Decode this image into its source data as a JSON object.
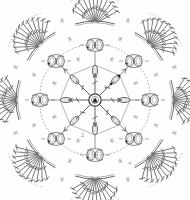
{
  "diagram": {
    "kind": "crochet-stitch-chart",
    "symmetry": 8,
    "background_color": "#fefefe",
    "ink_color": "#4a4a4a",
    "light_ink_color": "#8d8d8d",
    "labels": [
      {
        "id": "round-1",
        "text": "1",
        "x": 104,
        "y": 84
      },
      {
        "id": "round-2",
        "text": "2",
        "x": 81,
        "y": 132
      },
      {
        "id": "round-4",
        "text": "4",
        "x": 128,
        "y": 160
      },
      {
        "id": "round-5",
        "text": "5",
        "x": 162,
        "y": 30
      }
    ],
    "center": {
      "cx": 95,
      "cy": 100,
      "ring_radius": 7,
      "spokes": 8
    },
    "rounds": [
      {
        "number": 1,
        "name": "center-ring-spokes",
        "element": "double-crochet-spokes",
        "count": 8,
        "radius_inner": 7,
        "radius_outer": 27
      },
      {
        "number": 2,
        "name": "inner-chain-oval-ring",
        "element": "chain-loop-oval",
        "count": 8,
        "radius": 30
      },
      {
        "number": 3,
        "name": "mid-chain-arc-ring",
        "element": "chain-arc",
        "count": 8,
        "radius": 45
      },
      {
        "number": 4,
        "name": "puff-cluster-ring",
        "element": "puff-bobble-pair",
        "count": 8,
        "radius": 57
      },
      {
        "number": 5,
        "name": "outer-fan-ring",
        "element": "fan-shell",
        "count": 8,
        "radius": 78,
        "spokes_per_fan": 12
      }
    ],
    "markers": {
      "slip_stitch_dots": 8,
      "arrow_heads": 8,
      "cross_marks": 24
    }
  }
}
